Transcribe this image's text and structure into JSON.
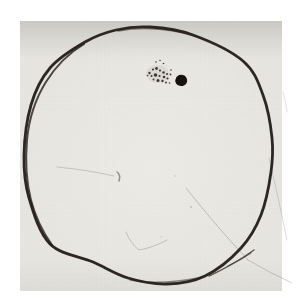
{
  "palette": {
    "margin": "#ffffff",
    "paper": "#e9e7e2",
    "halftone_dot": "#d7d4ce",
    "halftone_dot2": "#dedbd5",
    "shade": "#8f8d87",
    "ink": "#2d2721",
    "spot_ink": "#17120d",
    "smudge": "#6a6458"
  },
  "paper": {
    "x": 20,
    "y": 21,
    "w": 262,
    "h": 270
  },
  "drawing": {
    "disk": {
      "stroke_width": 2.8,
      "points": [
        [
          150,
          27
        ],
        [
          193,
          35
        ],
        [
          243,
          61
        ],
        [
          263,
          95
        ],
        [
          272,
          138
        ],
        [
          271,
          172
        ],
        [
          261,
          215
        ],
        [
          241,
          248
        ],
        [
          205,
          276
        ],
        [
          167,
          284
        ],
        [
          128,
          278
        ],
        [
          93,
          262
        ],
        [
          50,
          244
        ],
        [
          29,
          198
        ],
        [
          24,
          156
        ],
        [
          31,
          105
        ],
        [
          50,
          68
        ],
        [
          85,
          42
        ],
        [
          116,
          30
        ]
      ]
    },
    "sunspot_group": {
      "halo": {
        "cx": 157.5,
        "cy": 74,
        "rx": 11.5,
        "ry": 9,
        "opacity": 0.1
      },
      "major_spot": {
        "path": "M175.6,79.3 C176.2,76.2 178.7,74.6 181.6,74.8 C184.9,75.1 187,77.3 187.1,80.4 C187.2,83.5 184.9,85.8 181.5,86 C178.2,86.2 175.8,84.4 175.3,81.6 C175.1,80.8 175.3,80 175.6,79.3 Z"
      },
      "minor_spots": [
        [
          156,
          62,
          0.8
        ],
        [
          160,
          60.5,
          0.7
        ],
        [
          163.5,
          63.5,
          0.8
        ],
        [
          149.5,
          73,
          1.2
        ],
        [
          153,
          69.5,
          1.1
        ],
        [
          156.5,
          68.5,
          1.4
        ],
        [
          160,
          70.5,
          1.1
        ],
        [
          163.5,
          72.5,
          1.2
        ],
        [
          167,
          74,
          1.0
        ],
        [
          171,
          70,
          0.8
        ],
        [
          170.5,
          74.5,
          0.9
        ],
        [
          147.5,
          75.5,
          0.8
        ],
        [
          151.5,
          76,
          1.0
        ],
        [
          155.5,
          75,
          1.8
        ],
        [
          159.5,
          76,
          1.1
        ],
        [
          164,
          77,
          1.3
        ],
        [
          167.5,
          78.5,
          1.1
        ],
        [
          153.5,
          79.5,
          0.9
        ],
        [
          158,
          80.5,
          1.5
        ],
        [
          162.5,
          81,
          1.2
        ],
        [
          166,
          82.5,
          1.0
        ],
        [
          169.5,
          83,
          0.8
        ]
      ]
    },
    "strokes": [
      {
        "name": "left-arc-overdraw",
        "d": "M84,44 C54,62 31,96 27,140 C23,186 33,218 52,245",
        "color": "#241e18",
        "width": 2,
        "opacity": 0.8
      },
      {
        "name": "top-arc-overdraw",
        "d": "M118,31 C145,26 175,29 200,38",
        "color": "#2a241e",
        "width": 1.3,
        "opacity": 0.55
      },
      {
        "name": "bottom-arc-overdraw",
        "d": "M130,280 C155,285 183,281 203,277",
        "color": "#2a241e",
        "width": 1.4,
        "opacity": 0.5
      },
      {
        "name": "double-stroke-closing",
        "d": "M209,276 Q233,265 254,250",
        "color": "#3a332b",
        "width": 1.4,
        "opacity": 0.8
      },
      {
        "name": "double-stroke-inner",
        "d": "M228,266 Q241,260 251,253",
        "color": "#453d34",
        "width": 1.1,
        "opacity": 0.7
      },
      {
        "name": "faint-curve-inner",
        "d": "M186,188 Q216,226 248,260",
        "color": "#6e695f",
        "width": 1,
        "opacity": 0.35
      },
      {
        "name": "faint-curve-outer",
        "d": "M248,260 Q270,273 292,283",
        "color": "#6e695f",
        "width": 1,
        "opacity": 0.3
      },
      {
        "name": "faint-right-scratch",
        "d": "M269,158 Q279,200 287,240",
        "color": "#76716a",
        "width": 1,
        "opacity": 0.25
      },
      {
        "name": "faint-right-upper-scratch",
        "d": "M283,92 Q286,102 287,112",
        "color": "#76716a",
        "width": 1,
        "opacity": 0.22
      },
      {
        "name": "faint-left-scratch",
        "d": "M57,167 Q88,170 114,176",
        "color": "#6e695f",
        "width": 1,
        "opacity": 0.3
      },
      {
        "name": "comma-mark",
        "d": "M117,172 Q121,175 119,181",
        "color": "#4a443c",
        "width": 1.5,
        "opacity": 0.55
      },
      {
        "name": "hook-scratch",
        "d": "M126,232 Q130,243 139,250 Q152,248 167,240",
        "color": "#6e695f",
        "width": 1,
        "opacity": 0.32
      }
    ],
    "specks": [
      [
        191,
        207,
        0.9,
        0.35
      ],
      [
        175,
        176,
        0.8,
        0.28
      ],
      [
        161,
        237,
        0.7,
        0.3
      ]
    ]
  }
}
